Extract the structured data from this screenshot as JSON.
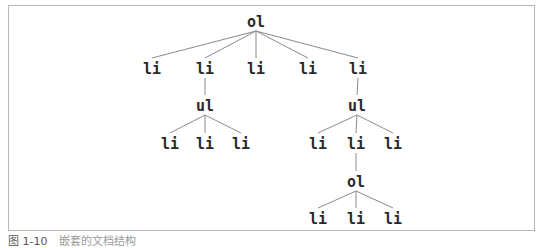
{
  "diagram": {
    "type": "tree",
    "nodes": [
      {
        "id": "n0",
        "label": "ol",
        "parent": null
      },
      {
        "id": "n1",
        "label": "li",
        "parent": "n0"
      },
      {
        "id": "n2",
        "label": "li",
        "parent": "n0"
      },
      {
        "id": "n3",
        "label": "li",
        "parent": "n0"
      },
      {
        "id": "n4",
        "label": "li",
        "parent": "n0"
      },
      {
        "id": "n5",
        "label": "li",
        "parent": "n0"
      },
      {
        "id": "n6",
        "label": "ul",
        "parent": "n2"
      },
      {
        "id": "n7",
        "label": "li",
        "parent": "n6"
      },
      {
        "id": "n8",
        "label": "li",
        "parent": "n6"
      },
      {
        "id": "n9",
        "label": "li",
        "parent": "n6"
      },
      {
        "id": "n10",
        "label": "ul",
        "parent": "n5"
      },
      {
        "id": "n11",
        "label": "li",
        "parent": "n10"
      },
      {
        "id": "n12",
        "label": "li",
        "parent": "n10"
      },
      {
        "id": "n13",
        "label": "li",
        "parent": "n10"
      },
      {
        "id": "n14",
        "label": "ol",
        "parent": "n12"
      },
      {
        "id": "n15",
        "label": "li",
        "parent": "n14"
      },
      {
        "id": "n16",
        "label": "li",
        "parent": "n14"
      },
      {
        "id": "n17",
        "label": "li",
        "parent": "n14"
      }
    ]
  },
  "caption": {
    "figure": "图 1-10",
    "text": "嵌套的文档结构"
  }
}
